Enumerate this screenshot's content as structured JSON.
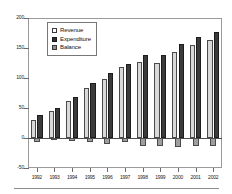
{
  "chart_data": {
    "type": "bar",
    "title": "",
    "subtitle": "",
    "xlabel": "",
    "ylabel": "",
    "ylim": [
      -50,
      200
    ],
    "yticks": [
      -50,
      0,
      50,
      100,
      150,
      200
    ],
    "ytick_labels": [
      "-50",
      "0",
      "50",
      "100",
      "150",
      "200"
    ],
    "grid": false,
    "legend_position": "upper-left-inside",
    "categories": [
      "1992",
      "1993",
      "1994",
      "1995",
      "1996",
      "1997",
      "1998",
      "1999",
      "2000",
      "2001",
      "2002"
    ],
    "series": [
      {
        "name": "Revenue",
        "color": "#d9d9d9",
        "values": [
          30,
          45,
          62,
          84,
          99,
          119,
          126,
          125,
          143,
          155,
          163
        ]
      },
      {
        "name": "Expenditure",
        "color": "#3b3b3b",
        "values": [
          38,
          50,
          68,
          91,
          108,
          124,
          138,
          138,
          157,
          169,
          177
        ]
      },
      {
        "name": "Balance",
        "color": "#9e9e9e",
        "values": [
          -6,
          -3,
          -5,
          -7,
          -10,
          -6,
          -13,
          -13,
          -15,
          -14,
          -13
        ]
      }
    ]
  },
  "legend": {
    "items": [
      {
        "label": "Revenue",
        "swatch": "revenue-swatch"
      },
      {
        "label": "Expenditure",
        "swatch": "expenditure-swatch"
      },
      {
        "label": "Balance",
        "swatch": "balance-swatch"
      }
    ]
  },
  "axes": {
    "y_tick_labels": [
      "200",
      "150",
      "100",
      "50",
      "0",
      "-50"
    ],
    "x_tick_labels": [
      "1992",
      "1993",
      "1994",
      "1995",
      "1996",
      "1997",
      "1998",
      "1999",
      "2000",
      "2001",
      "2002"
    ]
  }
}
